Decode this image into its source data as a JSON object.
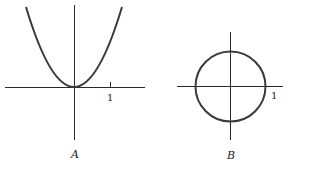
{
  "figures": [
    {
      "id": "A",
      "caption": "A",
      "description": "Parabola y = x^2 with vertex at origin",
      "tick_label": "1"
    },
    {
      "id": "B",
      "caption": "B",
      "description": "Unit circle x^2 + y^2 = 1 centered at origin",
      "tick_label": "1"
    }
  ],
  "colors": {
    "curve": "#3a3a3a",
    "axis": "#2a2a2a",
    "background": "#ffffff"
  }
}
